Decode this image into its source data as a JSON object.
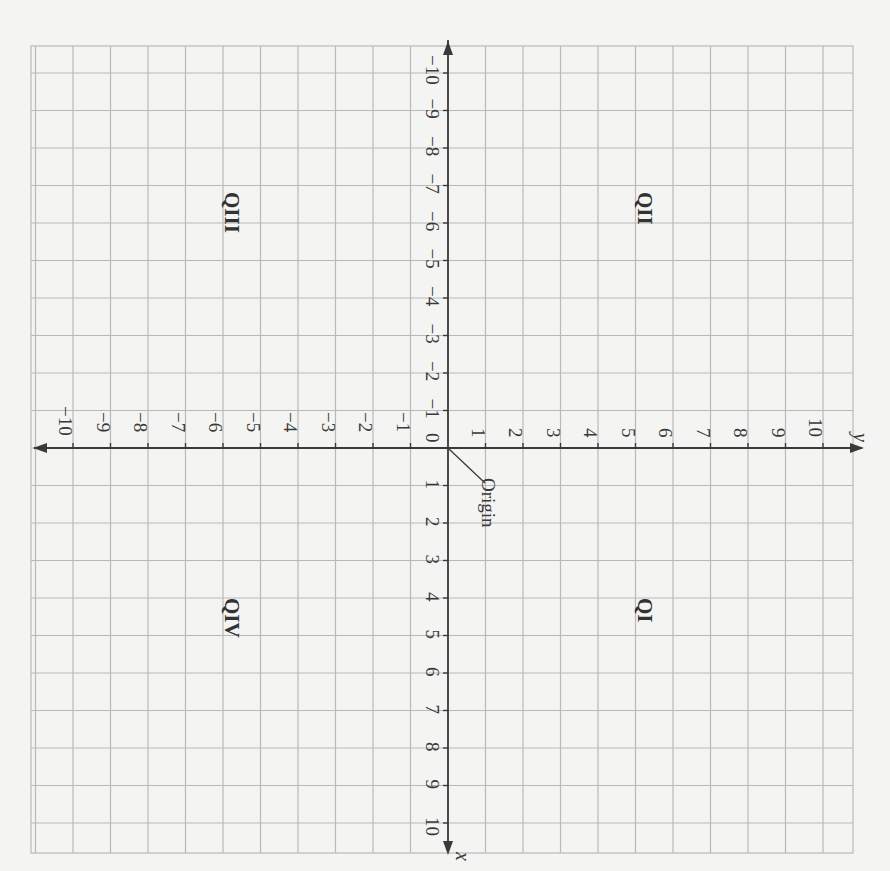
{
  "diagram": {
    "title": "",
    "type": "coordinate-plane",
    "orientation": "rotated 90 degrees clockwise",
    "colors": {
      "background": "#f4f4f2",
      "grid": "#b9b9b9",
      "axis": "#3a3a3a",
      "text": "#333333"
    },
    "axes": {
      "x": {
        "name": "x",
        "min": -10,
        "max": 10,
        "positive_tick_labels": [
          "1",
          "2",
          "3",
          "4",
          "5",
          "6",
          "7",
          "8",
          "9",
          "10"
        ],
        "negative_tick_labels": [
          "−1",
          "−2",
          "−3",
          "−4",
          "−5",
          "−6",
          "−7",
          "−8",
          "−9",
          "−10"
        ]
      },
      "y": {
        "name": "y",
        "min": -10,
        "max": 10,
        "positive_tick_labels": [
          "1",
          "2",
          "3",
          "4",
          "5",
          "6",
          "7",
          "8",
          "9",
          "10"
        ],
        "negative_tick_labels": [
          "−1",
          "−2",
          "−3",
          "−4",
          "−5",
          "−6",
          "−7",
          "−8",
          "−9",
          "−10"
        ]
      },
      "origin_label": "0"
    },
    "annotations": {
      "origin_callout": "Origin"
    },
    "quadrants": {
      "q1": "QI",
      "q2": "QII",
      "q3": "QIII",
      "q4": "QIV"
    }
  }
}
